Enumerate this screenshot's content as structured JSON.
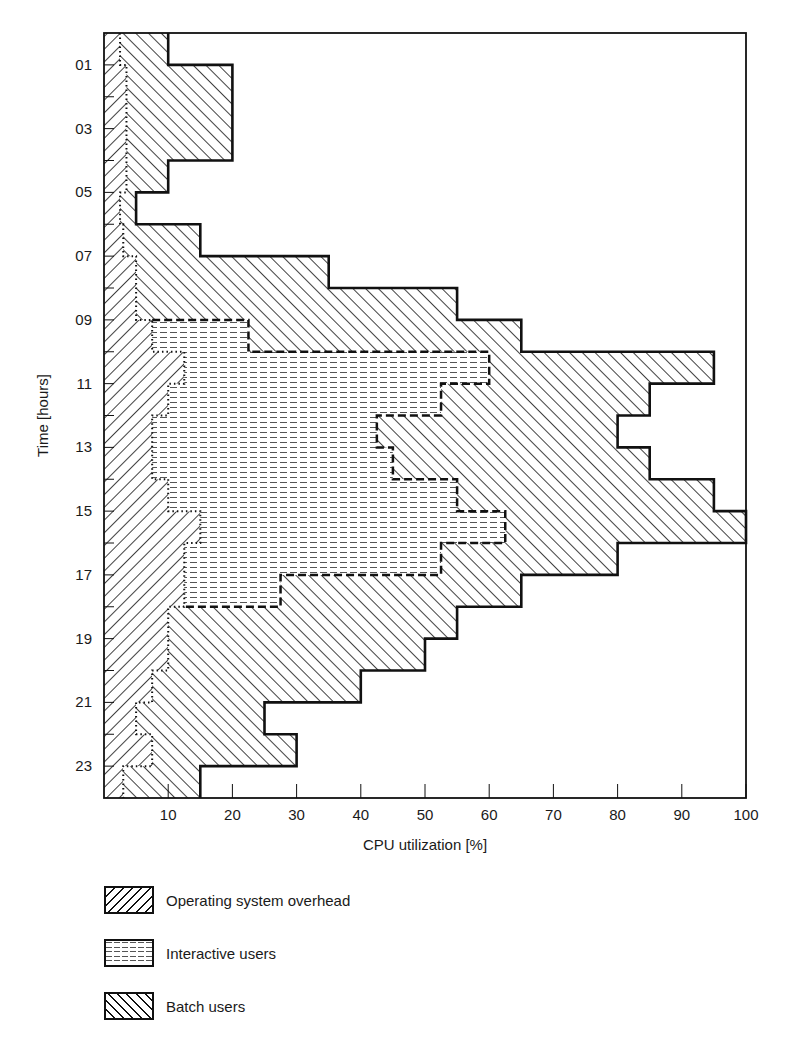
{
  "chart_data": {
    "type": "area",
    "orientation": "horizontal-step",
    "title": "",
    "xlabel": "CPU utilization [%]",
    "ylabel": "Time [hours]",
    "xlim": [
      0,
      100
    ],
    "ylim": [
      0,
      24
    ],
    "x_ticks": [
      10,
      20,
      30,
      40,
      50,
      60,
      70,
      80,
      90,
      100
    ],
    "x_tick_labels": [
      "10",
      "20",
      "30",
      "40",
      "50",
      "60",
      "70",
      "80",
      "90",
      "100"
    ],
    "y_tick_labels": [
      "01",
      "03",
      "05",
      "07",
      "09",
      "11",
      "13",
      "15",
      "17",
      "19",
      "21",
      "23"
    ],
    "hours": [
      0,
      1,
      2,
      3,
      4,
      5,
      6,
      7,
      8,
      9,
      10,
      11,
      12,
      13,
      14,
      15,
      16,
      17,
      18,
      19,
      20,
      21,
      22,
      23
    ],
    "stacked": true,
    "series": [
      {
        "name": "Operating system overhead",
        "pattern": "hatch-forward",
        "values": [
          2.5,
          3.5,
          3.5,
          3.5,
          3.5,
          2.5,
          3,
          5,
          5,
          7.5,
          12.5,
          10,
          7.5,
          7.5,
          10,
          15,
          12.5,
          12.5,
          10,
          10,
          7.5,
          5,
          7.5,
          3
        ]
      },
      {
        "name": "Interactive users",
        "pattern": "dashed-horizontal",
        "values": [
          0,
          0,
          0,
          0,
          0,
          0,
          0,
          0,
          0,
          15,
          47.5,
          42.5,
          35,
          37.5,
          45,
          47.5,
          40,
          15,
          0,
          0,
          0,
          0,
          0,
          0
        ]
      },
      {
        "name": "Batch users",
        "pattern": "hatch-backward",
        "values": [
          7.5,
          16.5,
          16.5,
          16.5,
          6.5,
          2.5,
          12,
          30,
          50,
          42.5,
          35,
          32.5,
          37.5,
          40,
          40,
          37.5,
          27.5,
          37.5,
          45,
          40,
          32.5,
          20,
          22.5,
          12
        ]
      }
    ],
    "cumulative_boundaries": {
      "os_top": [
        2.5,
        3.5,
        3.5,
        3.5,
        3.5,
        2.5,
        3,
        5,
        5,
        7.5,
        12.5,
        10,
        7.5,
        7.5,
        10,
        15,
        12.5,
        12.5,
        10,
        10,
        7.5,
        5,
        7.5,
        3
      ],
      "interactive_top": [
        2.5,
        3.5,
        3.5,
        3.5,
        3.5,
        2.5,
        3,
        5,
        5,
        22.5,
        60,
        52.5,
        42.5,
        45,
        55,
        62.5,
        52.5,
        27.5,
        10,
        10,
        7.5,
        5,
        7.5,
        3
      ],
      "total": [
        10,
        20,
        20,
        20,
        10,
        5,
        15,
        35,
        55,
        65,
        95,
        85,
        80,
        85,
        95,
        100,
        80,
        65,
        55,
        50,
        40,
        25,
        30,
        15
      ]
    },
    "grid": false,
    "legend_position": "below"
  },
  "legend": {
    "items": [
      {
        "label": "Operating system overhead"
      },
      {
        "label": "Interactive users"
      },
      {
        "label": "Batch users"
      }
    ]
  }
}
